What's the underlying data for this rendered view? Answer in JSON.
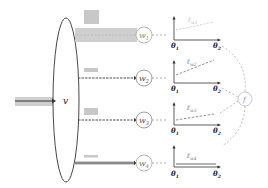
{
  "diagram": {
    "input_node": {
      "label": "v"
    },
    "workers": [
      {
        "id": "w1",
        "label": "w",
        "sub": "1",
        "loss_label": "ℓ",
        "loss_sub": "w1",
        "bar_style": "thick-gray",
        "loss_slope": "shallow",
        "arc_to_f": true
      },
      {
        "id": "w2",
        "label": "w",
        "sub": "2",
        "loss_label": "ℓ",
        "loss_sub": "w2",
        "bar_style": "dashed-dark",
        "loss_slope": "steep"
      },
      {
        "id": "w3",
        "label": "w",
        "sub": "3",
        "loss_label": "ℓ",
        "loss_sub": "w3",
        "bar_style": "dashed-dark",
        "loss_slope": "moderate"
      },
      {
        "id": "w4",
        "label": "w",
        "sub": "4",
        "loss_label": "ℓ",
        "loss_sub": "w4",
        "bar_style": "solid-double",
        "loss_slope": "flat"
      }
    ],
    "axes": {
      "x_label": "θ",
      "x_sub": "2",
      "y_label": "θ",
      "y_sub": "1"
    },
    "aggregator": {
      "label": "f"
    },
    "colors": {
      "stroke": "#333333",
      "light_stroke": "#aaaaaa",
      "bar_gray": "#c8c8c8",
      "dashed": "#999999"
    }
  }
}
